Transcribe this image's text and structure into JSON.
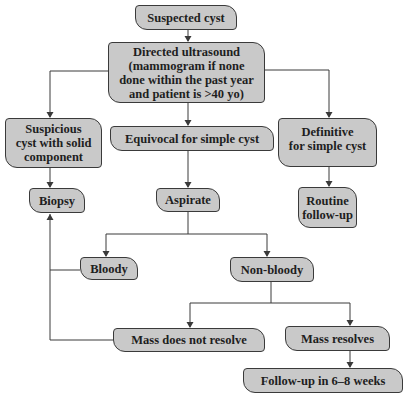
{
  "diagram": {
    "type": "flowchart",
    "colors": {
      "node_fill": "#c9c9c9",
      "node_border": "#3a3a3a",
      "text": "#1e1e1e",
      "line": "#3a3a3a"
    },
    "nodes": {
      "suspected_cyst": {
        "label": "Suspected cyst"
      },
      "directed_ultrasound": {
        "lines": [
          "Directed ultrasound",
          "(mammogram if none",
          "done within the past year",
          "and patient is >40 yo)"
        ]
      },
      "suspicious": {
        "lines": [
          "Suspicious",
          "cyst with solid",
          "component"
        ]
      },
      "equivocal": {
        "label": "Equivocal for simple cyst"
      },
      "definitive": {
        "lines": [
          "Definitive",
          "for simple cyst"
        ]
      },
      "biopsy": {
        "label": "Biopsy"
      },
      "aspirate": {
        "label": "Aspirate"
      },
      "routine": {
        "lines": [
          "Routine",
          "follow-up"
        ]
      },
      "bloody": {
        "label": "Bloody"
      },
      "non_bloody": {
        "label": "Non-bloody"
      },
      "mass_not_resolve": {
        "label": "Mass does not resolve"
      },
      "mass_resolves": {
        "label": "Mass resolves"
      },
      "followup": {
        "label": "Follow-up in 6–8 weeks"
      }
    },
    "edges": [
      [
        "Suspected cyst",
        "Directed ultrasound"
      ],
      [
        "Directed ultrasound",
        "Suspicious cyst with solid component"
      ],
      [
        "Directed ultrasound",
        "Equivocal for simple cyst"
      ],
      [
        "Directed ultrasound",
        "Definitive for simple cyst"
      ],
      [
        "Suspicious cyst with solid component",
        "Biopsy"
      ],
      [
        "Equivocal for simple cyst",
        "Aspirate"
      ],
      [
        "Definitive for simple cyst",
        "Routine follow-up"
      ],
      [
        "Aspirate",
        "Bloody"
      ],
      [
        "Aspirate",
        "Non-bloody"
      ],
      [
        "Bloody",
        "Biopsy"
      ],
      [
        "Non-bloody",
        "Mass does not resolve"
      ],
      [
        "Non-bloody",
        "Mass resolves"
      ],
      [
        "Mass does not resolve",
        "Biopsy"
      ],
      [
        "Mass resolves",
        "Follow-up in 6–8 weeks"
      ]
    ]
  }
}
